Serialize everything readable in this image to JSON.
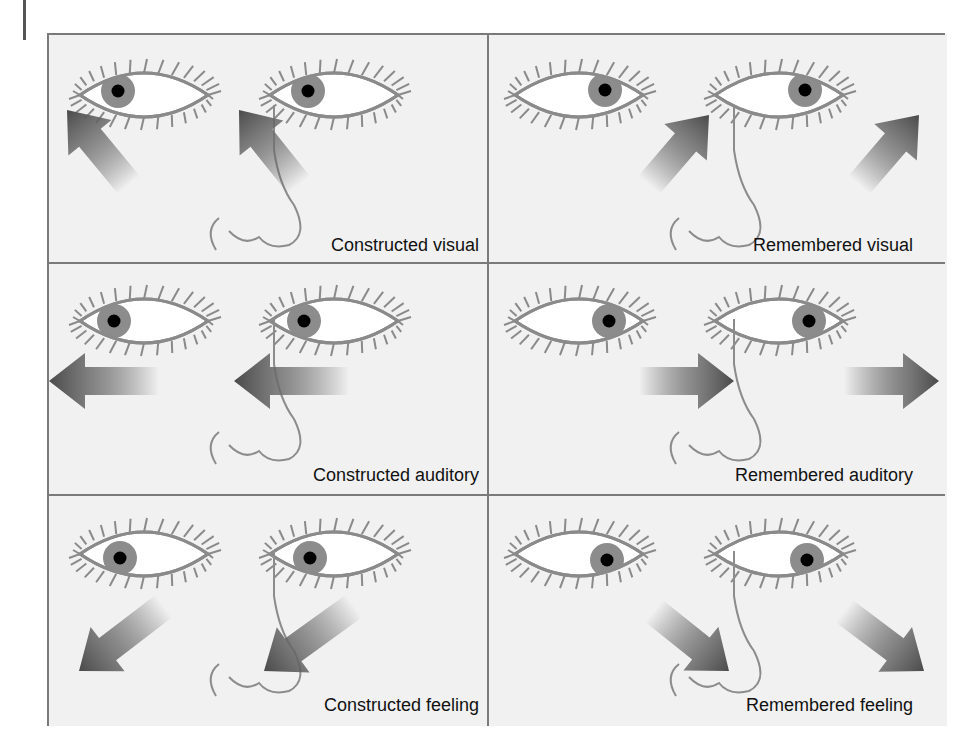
{
  "figure": {
    "colors": {
      "background": "#f1f1f1",
      "rule": "#7a7a7a",
      "eye_outline": "#8a8a8a",
      "iris": "#8c8c8c",
      "pupil": "#000000",
      "arrow_dark": "#4a4a4a"
    },
    "cells": [
      {
        "label": "Constructed visual",
        "gaze": "up-left",
        "row": 0,
        "col": 0
      },
      {
        "label": "Remembered visual",
        "gaze": "up-right",
        "row": 0,
        "col": 1
      },
      {
        "label": "Constructed auditory",
        "gaze": "left",
        "row": 1,
        "col": 0
      },
      {
        "label": "Remembered auditory",
        "gaze": "right",
        "row": 1,
        "col": 1
      },
      {
        "label": "Constructed feeling",
        "gaze": "down-left",
        "row": 2,
        "col": 0
      },
      {
        "label": "Remembered feeling",
        "gaze": "down-right",
        "row": 2,
        "col": 1
      }
    ]
  }
}
